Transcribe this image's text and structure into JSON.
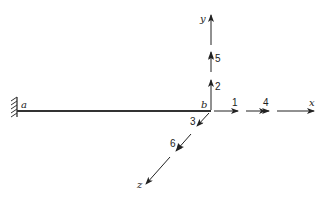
{
  "diagram": {
    "type": "cantilever beam with load/displacement coordinate numbering",
    "nodes": [
      {
        "id": "a",
        "label": "a",
        "support": "fixed"
      },
      {
        "id": "b",
        "label": "b",
        "support": "free"
      }
    ],
    "axes": {
      "x": "x",
      "y": "y",
      "z": "z"
    },
    "coordinates": [
      {
        "number": "1",
        "direction": "x",
        "type": "single-arrow"
      },
      {
        "number": "2",
        "direction": "y",
        "type": "single-arrow"
      },
      {
        "number": "3",
        "direction": "z",
        "type": "single-arrow"
      },
      {
        "number": "4",
        "direction": "x",
        "type": "double-arrow"
      },
      {
        "number": "5",
        "direction": "y",
        "type": "double-arrow"
      },
      {
        "number": "6",
        "direction": "z",
        "type": "double-arrow"
      }
    ],
    "colors": {
      "line": "#222222",
      "hatch": "#333333",
      "background": "#ffffff"
    }
  }
}
